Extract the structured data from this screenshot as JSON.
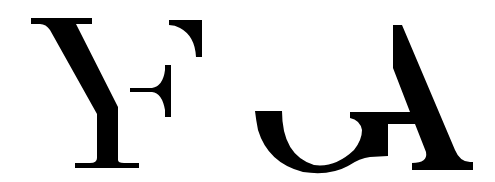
{
  "logo": {
    "label": "YF GA monogram",
    "letters": [
      "Y",
      "F",
      "G",
      "A"
    ],
    "background": "#ffffff",
    "ink": "#000000"
  }
}
